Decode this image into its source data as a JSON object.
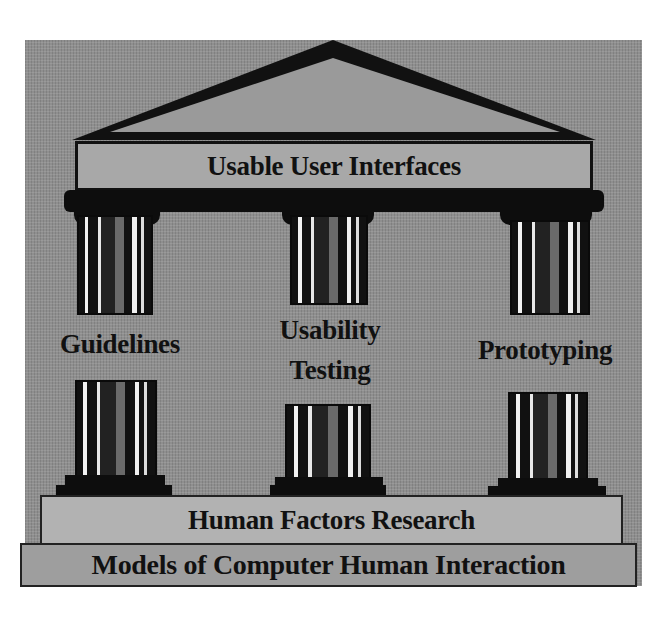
{
  "diagram": {
    "title": "Usable User Interfaces",
    "pillars": [
      {
        "label": "Guidelines"
      },
      {
        "label_line1": "Usability",
        "label_line2": "Testing"
      },
      {
        "label": "Prototyping"
      }
    ],
    "base_layer": "Human Factors Research",
    "foundation_layer": "Models of Computer Human Interaction"
  },
  "colors": {
    "background": "#8f8f8f",
    "beam": "#a8a8a8",
    "stone": "#b2b2b2",
    "ink": "#111111"
  }
}
